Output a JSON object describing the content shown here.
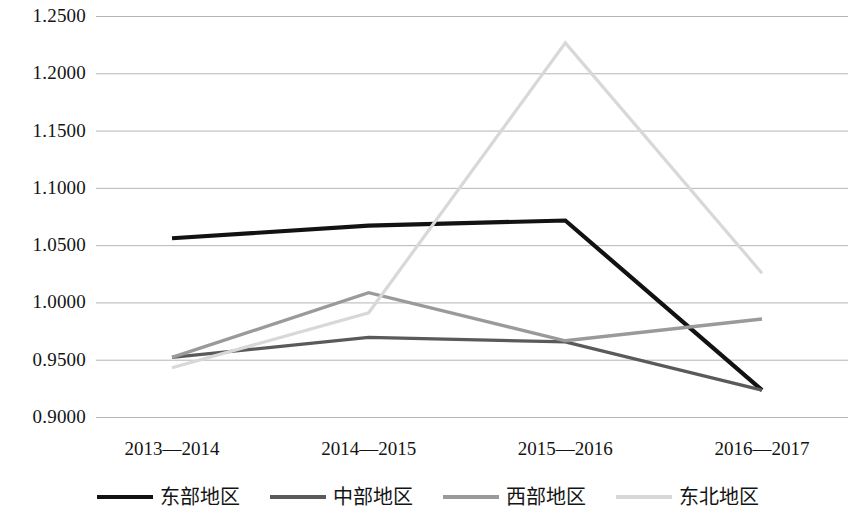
{
  "chart_data": {
    "type": "line",
    "title": "",
    "subtitle": "",
    "xlabel": "",
    "ylabel": "",
    "categories": [
      "2013—2014",
      "2014—2015",
      "2015—2016",
      "2016—2017"
    ],
    "ylim": [
      0.9,
      1.25
    ],
    "y_ticks": [
      1.25,
      1.2,
      1.15,
      1.1,
      1.05,
      1.0,
      0.95,
      0.9
    ],
    "y_tick_labels": [
      "1.2500",
      "1.2000",
      "1.1500",
      "1.1000",
      "1.0500",
      "1.0000",
      "0.9500",
      "0.9000"
    ],
    "grid": "horizontal",
    "legend_position": "bottom",
    "series": [
      {
        "name": "东部地区",
        "color": "#121212",
        "width": 4.2,
        "dash": "none",
        "values": [
          1.056,
          1.067,
          1.0715,
          0.9235
        ]
      },
      {
        "name": "中部地区",
        "color": "#5a5a5a",
        "width": 3.2,
        "dash": "none",
        "values": [
          0.952,
          0.9695,
          0.9655,
          0.9235
        ]
      },
      {
        "name": "西部地区",
        "color": "#9a9a9a",
        "width": 3.4,
        "dash": "none",
        "values": [
          0.952,
          1.0085,
          0.9665,
          0.9855
        ]
      },
      {
        "name": "东北地区",
        "color": "#d8d8d8",
        "width": 3.2,
        "dash": "none",
        "values": [
          0.943,
          0.991,
          1.2265,
          1.0255
        ]
      }
    ]
  },
  "axes": {
    "gridline_color": "#b5b5b5",
    "label_color": "#141414"
  }
}
